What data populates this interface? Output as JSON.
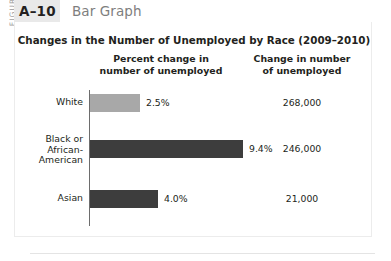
{
  "figure": {
    "side_label": "FIGURE",
    "number": "A–10",
    "kind": "Bar Graph"
  },
  "chart_data": {
    "type": "bar",
    "orientation": "horizontal",
    "title": "Changes in the Number of Unemployed by Race (2009–2010)",
    "xlabel": "",
    "ylabel": "",
    "grid": false,
    "legend": "none",
    "columns": [
      "Percent change in\nnumber of unemployed",
      "Change in number\nof unemployed"
    ],
    "column_headers": {
      "percent": {
        "line1": "Percent change in",
        "line2": "number of unemployed"
      },
      "number": {
        "line1": "Change in number",
        "line2": "of unemployed"
      }
    },
    "categories": [
      "White",
      "Black or African-American",
      "Asian"
    ],
    "values": [
      2.5,
      9.4,
      4.0
    ],
    "value_labels": [
      "2.5%",
      "4.0%",
      "9.4%"
    ],
    "rows": [
      {
        "label_lines": [
          "White"
        ],
        "percent": 2.5,
        "percent_label": "2.5%",
        "count_label": "268,000",
        "bar_color": "#a8a8a8",
        "bar_width_px": 50
      },
      {
        "label_lines": [
          "Black or",
          "African-",
          "American"
        ],
        "percent": 9.4,
        "percent_label": "9.4%",
        "count_label": "246,000",
        "bar_color": "#3d3d3d",
        "bar_width_px": 153
      },
      {
        "label_lines": [
          "Asian"
        ],
        "percent": 4.0,
        "percent_label": "4.0%",
        "count_label": "21,000",
        "bar_color": "#3d3d3d",
        "bar_width_px": 68
      }
    ],
    "colors": {
      "bar_light": "#a8a8a8",
      "bar_dark": "#3d3d3d",
      "axis": "#6d6d6d",
      "text": "#231f20"
    }
  }
}
